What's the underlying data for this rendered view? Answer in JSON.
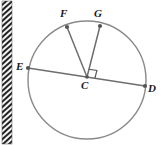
{
  "figure": {
    "kind": "circle-geometry-diagram",
    "width": 164,
    "height": 145,
    "background_color": "#ffffff",
    "stroke_color": "#8a8a8a",
    "chord_color": "#6e6e6e",
    "label_color": "#1a1a1a",
    "point_color": "#555555"
  },
  "circle": {
    "center_label": "C",
    "cx": 87,
    "cy": 80,
    "r": 59,
    "stroke_width": 1.4
  },
  "points": [
    {
      "id": "E",
      "label": "E",
      "x": 28,
      "y": 68,
      "label_x": 16,
      "label_y": 61
    },
    {
      "id": "D",
      "label": "D",
      "x": 145,
      "y": 86,
      "label_x": 148,
      "label_y": 83
    },
    {
      "id": "F",
      "label": "F",
      "x": 67,
      "y": 27,
      "label_x": 60,
      "label_y": 8
    },
    {
      "id": "G",
      "label": "G",
      "x": 100,
      "y": 26,
      "label_x": 94,
      "label_y": 8
    },
    {
      "id": "C",
      "label": "C",
      "x": 87,
      "y": 77,
      "label_x": 81,
      "label_y": 80
    }
  ],
  "segments": [
    {
      "id": "ED",
      "from": "E",
      "to": "D",
      "type": "diameter"
    },
    {
      "id": "CF",
      "from": "C",
      "to": "F",
      "type": "radius"
    },
    {
      "id": "CG",
      "from": "C",
      "to": "G",
      "type": "radius"
    }
  ],
  "right_angle_marker": {
    "id": "angle-GCD",
    "between": [
      "CG",
      "CD"
    ],
    "size": 8,
    "x": 88,
    "y": 65
  },
  "scan_artifact": {
    "name": "page-edge-hatch-band",
    "x": 2,
    "y": 1,
    "width": 10,
    "height": 143,
    "color": "#2b2b2b"
  }
}
